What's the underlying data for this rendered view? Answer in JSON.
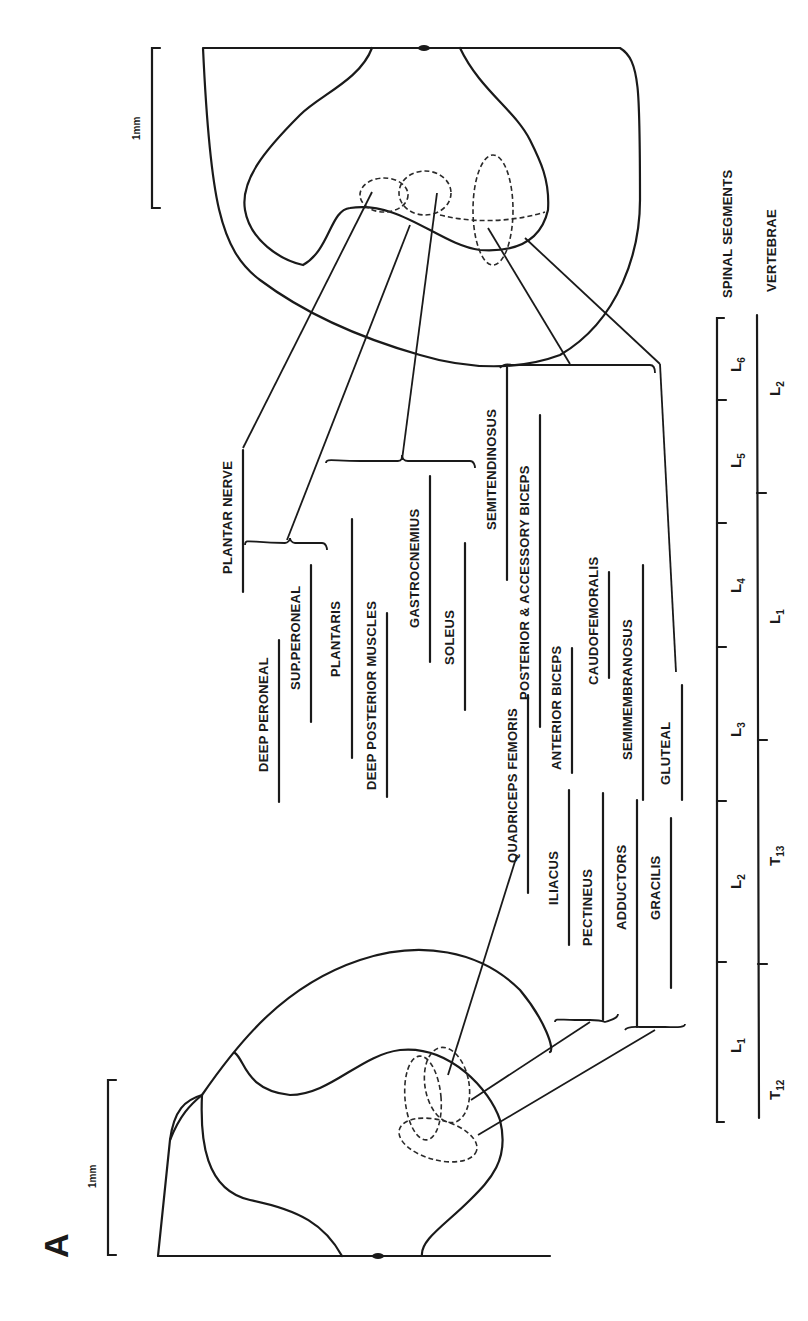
{
  "figure": {
    "panel_label": "A",
    "orientation": "rotated 90 degrees counter-clockwise; text reads bottom-to-top"
  },
  "scale_bars": [
    {
      "id": "caudal-section-scale",
      "label": "1mm"
    },
    {
      "id": "rostral-section-scale",
      "label": "1mm"
    }
  ],
  "axes": {
    "spinal_segments": {
      "title": "SPINAL SEGMENTS",
      "segments": [
        {
          "label": "L",
          "sub": "6"
        },
        {
          "label": "L",
          "sub": "5"
        },
        {
          "label": "L",
          "sub": "4"
        },
        {
          "label": "L",
          "sub": "3"
        },
        {
          "label": "L",
          "sub": "2"
        },
        {
          "label": "L",
          "sub": "1"
        }
      ]
    },
    "vertebrae": {
      "title": "VERTEBRAE",
      "segments": [
        {
          "label": "L",
          "sub": "2"
        },
        {
          "label": "L",
          "sub": "1"
        },
        {
          "label": "T",
          "sub": "13"
        },
        {
          "label": "T",
          "sub": "12"
        }
      ]
    }
  },
  "motor_pools": {
    "nerves": [
      {
        "label": "PLANTAR NERVE"
      },
      {
        "label": "DEEP PERONEAL"
      },
      {
        "label": "SUP.PERONEAL"
      }
    ],
    "muscles": [
      {
        "label": "PLANTARIS"
      },
      {
        "label": "DEEP POSTERIOR MUSCLES"
      },
      {
        "label": "GASTROCNEMIUS"
      },
      {
        "label": "SOLEUS"
      },
      {
        "label": "SEMITENDINOSUS"
      },
      {
        "label": "POSTERIOR & ACCESSORY BICEPS"
      },
      {
        "label": "QUADRICEPS FEMORIS"
      },
      {
        "label": "ANTERIOR BICEPS"
      },
      {
        "label": "CAUDOFEMORALIS"
      },
      {
        "label": "SEMIMEMBRANOSUS"
      },
      {
        "label": "ILIACUS"
      },
      {
        "label": "PECTINEUS"
      },
      {
        "label": "ADDUCTORS"
      },
      {
        "label": "GRACILIS"
      },
      {
        "label": "GLUTEAL"
      }
    ]
  }
}
